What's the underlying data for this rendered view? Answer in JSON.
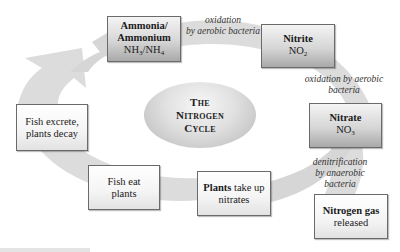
{
  "diagram": {
    "title": {
      "line1": "The",
      "line2": "Nitrogen",
      "line3": "Cycle"
    },
    "nodes": [
      {
        "id": "ammonia",
        "lines": [
          "Ammonia/",
          "Ammonium"
        ],
        "formula": {
          "a": "NH",
          "a_sub": "3",
          "sep": "/NH",
          "b_sub": "4"
        },
        "style": "dark"
      },
      {
        "id": "nitrite",
        "bold": "Nitrite",
        "formula": {
          "a": "NO",
          "a_sub": "2"
        },
        "style": "dark"
      },
      {
        "id": "nitrate",
        "bold": "Nitrate",
        "formula": {
          "a": "NO",
          "a_sub": "3"
        },
        "style": "dark"
      },
      {
        "id": "nitrogen-gas",
        "bold": "Nitrogen gas",
        "text": "released",
        "style": "light"
      },
      {
        "id": "plants",
        "bold": "Plants",
        "text_inline": " take up",
        "text": "nitrates",
        "style": "light"
      },
      {
        "id": "fish-eat",
        "line1": "Fish eat",
        "line2": "plants",
        "style": "light"
      },
      {
        "id": "fish-excrete",
        "line1": "Fish excrete,",
        "line2": "plants decay",
        "style": "light"
      }
    ],
    "edge_labels": [
      {
        "id": "ammonia-to-nitrite",
        "line1": "oxidation",
        "line2": "by aerobic bacteria"
      },
      {
        "id": "nitrite-to-nitrate",
        "line1": "oxidation by aerobic",
        "line2": "bacteria"
      },
      {
        "id": "nitrate-to-nitrogen",
        "line1": "denitrification",
        "line2": "by anaerobic",
        "line3": "bacteria"
      }
    ],
    "colors": {
      "band": "#dcdcdc",
      "box_border": "#6a6a6a",
      "background": "#ffffff"
    }
  }
}
